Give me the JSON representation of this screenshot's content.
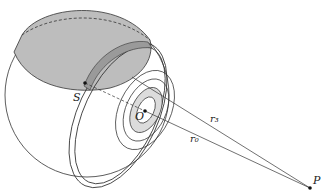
{
  "diagram": {
    "labels": {
      "S": "S",
      "O": "O",
      "P": "P",
      "r3": "r₃",
      "r0": "r₀"
    },
    "colors": {
      "stroke": "#333333",
      "shaded_cap": "#bdbdbd",
      "band": "#9a9a9a",
      "ring": "#dcdcdc",
      "background": "#ffffff"
    }
  }
}
